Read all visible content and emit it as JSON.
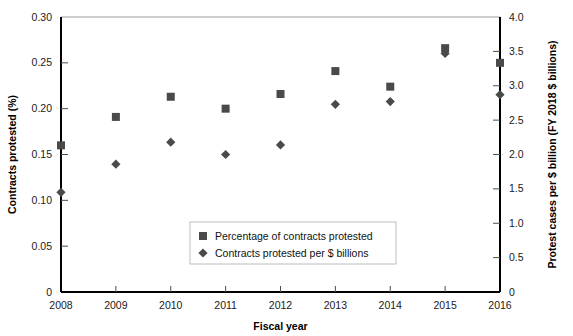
{
  "chart_data": {
    "type": "scatter",
    "title": "",
    "xlabel": "Fiscal year",
    "ylabel": "Contracts protested (%)",
    "y2label": "Protest cases per $ billion (FY 2018 $ billions)",
    "categories": [
      2008,
      2009,
      2010,
      2011,
      2012,
      2013,
      2014,
      2015,
      2016
    ],
    "x": [
      2008,
      2009,
      2010,
      2011,
      2012,
      2013,
      2014,
      2015,
      2016
    ],
    "xlim": [
      2008,
      2016
    ],
    "ylim": [
      0,
      0.3
    ],
    "y2lim": [
      0,
      4.0
    ],
    "grid": false,
    "legend_position": "center",
    "xticks": [
      "2008",
      "2009",
      "2010",
      "2011",
      "2012",
      "2013",
      "2014",
      "2015",
      "2016"
    ],
    "yticks": [
      "0",
      "0.05",
      "0.10",
      "0.15",
      "0.20",
      "0.25",
      "0.30"
    ],
    "ytick_values": [
      0,
      0.05,
      0.1,
      0.15,
      0.2,
      0.25,
      0.3
    ],
    "y2ticks": [
      "0",
      "0.5",
      "1.0",
      "1.5",
      "2.0",
      "2.5",
      "3.0",
      "3.5",
      "4.0"
    ],
    "y2tick_values": [
      0,
      0.5,
      1.0,
      1.5,
      2.0,
      2.5,
      3.0,
      3.5,
      4.0
    ],
    "series": [
      {
        "name": "Percentage of contracts protested",
        "marker": "square",
        "axis": "left",
        "color": "#4a4a4a",
        "values": [
          0.16,
          0.191,
          0.213,
          0.2,
          0.216,
          0.241,
          0.224,
          0.266,
          0.25
        ]
      },
      {
        "name": "Contracts protested per $ billions",
        "marker": "diamond",
        "axis": "right",
        "color": "#4a4a4a",
        "values": [
          1.45,
          1.86,
          2.18,
          2.0,
          2.14,
          2.73,
          2.77,
          3.47,
          2.87
        ]
      }
    ]
  },
  "legend": {
    "entries": [
      {
        "label": "Percentage of contracts protested",
        "marker": "square"
      },
      {
        "label": "Contracts protested per $ billions",
        "marker": "diamond"
      }
    ]
  },
  "axes": {
    "x_title": "Fiscal year",
    "y_left_title": "Contracts protested (%)",
    "y_right_title": "Protest cases per $ billion (FY 2018 $ billions)"
  }
}
